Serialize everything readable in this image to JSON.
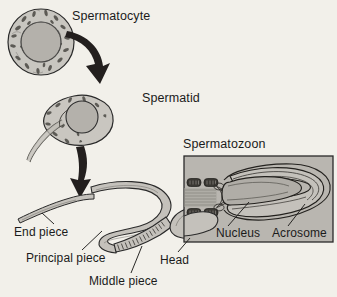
{
  "figure": {
    "background_color": "#f2f0ea",
    "ink_color": "#1b1b1b",
    "cell_fill": "#c9c6c0",
    "nucleus_fill": "#b4b1ab",
    "box_fill": "#b9b6b0"
  },
  "labels": {
    "spermatocyte": "Spermatocyte",
    "spermatid": "Spermatid",
    "spermatozoon": "Spermatozoon",
    "end_piece": "End piece",
    "principal_piece": "Principal piece",
    "middle_piece": "Middle piece",
    "head": "Head",
    "nucleus": "Nucleus",
    "acrosome": "Acrosome"
  }
}
